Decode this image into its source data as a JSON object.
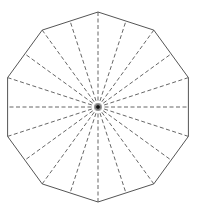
{
  "diagram": {
    "shape": "regular-decagon",
    "sides": 10,
    "center": [
      98,
      107
    ],
    "radius": 95,
    "start_angle_deg": -90,
    "outline_color": "#555555",
    "dash_color": "#555555",
    "center_dot_color": "#111111",
    "radial_lines": {
      "to_vertices": 10,
      "to_edge_midpoints": 10,
      "style": "dashed"
    }
  }
}
